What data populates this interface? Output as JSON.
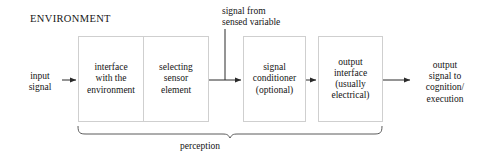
{
  "diagram": {
    "environment_label": "ENVIRONMENT",
    "input_label": "input\nsignal",
    "output_label": "output\nsignal to\ncognition/\nexecution",
    "sensed_label": "signal from\nsensed variable",
    "brace_label": "perception",
    "boxes": [
      {
        "id": "interface",
        "label": "interface\nwith the\nenvironment"
      },
      {
        "id": "sensor",
        "label": "selecting\nsensor\nelement"
      },
      {
        "id": "conditioner",
        "label": "signal\nconditioner\n(optional)"
      },
      {
        "id": "output",
        "label": "output\ninterface\n(usually\nelectrical)"
      }
    ],
    "colors": {
      "background": "#ffffff",
      "box_border": "#cfcfcf",
      "text": "#141414",
      "connector": "#2a2a2a",
      "brace": "#555555"
    },
    "arrows": [
      {
        "name": "input-arrow",
        "from": "input signal",
        "to": "interface with the environment"
      },
      {
        "name": "sensor-arrow",
        "from": "selecting sensor element",
        "to": "signal conditioner (optional)"
      },
      {
        "name": "conditioner-arrow",
        "from": "signal conditioner (optional)",
        "to": "output interface (usually electrical)"
      },
      {
        "name": "output-arrow",
        "from": "output interface (usually electrical)",
        "to": "output signal to cognition/execution"
      },
      {
        "name": "sensed-variable-line",
        "from": "signal from sensed variable",
        "to": "signal path"
      }
    ]
  }
}
